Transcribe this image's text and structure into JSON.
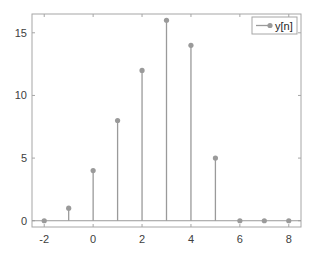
{
  "chart_data": {
    "type": "stem",
    "title": "",
    "xlabel": "",
    "ylabel": "",
    "x": [
      -2,
      -1,
      0,
      1,
      2,
      3,
      4,
      5,
      6,
      7,
      8
    ],
    "series": [
      {
        "name": "y[n]",
        "values": [
          0,
          1,
          4,
          8,
          12,
          16,
          14,
          5,
          0,
          0,
          0
        ],
        "color": "#9a9a9a"
      }
    ],
    "xlim": [
      -2.5,
      8.5
    ],
    "ylim": [
      -0.5,
      16.5
    ],
    "xticks": [
      -2,
      0,
      2,
      4,
      6,
      8
    ],
    "yticks": [
      0,
      5,
      10,
      15
    ],
    "grid": false,
    "legend_position": "northeast"
  },
  "legend": {
    "label": "y[n]"
  },
  "axes": {
    "xtick_labels": [
      "-2",
      "0",
      "2",
      "4",
      "6",
      "8"
    ],
    "ytick_labels": [
      "0",
      "5",
      "10",
      "15"
    ]
  },
  "colors": {
    "stem": "#9a9a9a",
    "axis": "#a6a6a6",
    "baseline": "#9a9a9a"
  }
}
